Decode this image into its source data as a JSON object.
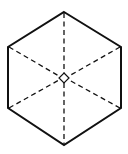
{
  "diagram": {
    "type": "cube-projection",
    "stroke_color": "#111111",
    "background": "#ffffff",
    "vertices": {
      "top": [
        64,
        12
      ],
      "upper_right": [
        121,
        47
      ],
      "lower_right": [
        121,
        108
      ],
      "bottom": [
        64,
        145
      ],
      "lower_left": [
        8,
        108
      ],
      "upper_left": [
        8,
        47
      ]
    },
    "center": [
      64,
      78
    ],
    "center_marker": "small-diamond"
  }
}
